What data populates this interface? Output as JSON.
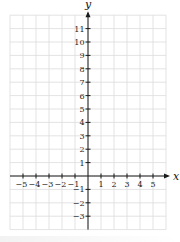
{
  "chart_data": {
    "type": "line",
    "title": "",
    "xlabel": "x",
    "ylabel": "y",
    "xlim": [
      -6,
      6
    ],
    "ylim": [
      -4,
      12
    ],
    "grid": true,
    "x_ticks": [
      -5,
      -4,
      -3,
      -2,
      -1,
      1,
      2,
      3,
      4,
      5
    ],
    "x_tick_labels": [
      "−5",
      "−4",
      "−3",
      "−2",
      "−1",
      "1",
      "2",
      "3",
      "4",
      "5"
    ],
    "y_ticks": [
      11,
      10,
      9,
      8,
      7,
      6,
      5,
      4,
      3,
      2,
      1,
      -1,
      -2,
      -3
    ],
    "y_tick_labels": [
      "11",
      "10",
      "9",
      "8",
      "7",
      "6",
      "5",
      "4",
      "3",
      "2",
      "1",
      "−1",
      "−2",
      "−3"
    ],
    "series": [],
    "legend": null
  },
  "style": {
    "grid_color": "#dcdcdc",
    "axis_color": "#1a1a1a",
    "background": "#ffffff"
  },
  "geometry": {
    "origin_px": [
      88,
      176
    ],
    "unit_x_px": 13,
    "unit_y_px": 13.4,
    "grid_left_px": 10,
    "grid_right_px": 166,
    "grid_top_px": 15.2,
    "grid_bottom_px": 229.6
  }
}
